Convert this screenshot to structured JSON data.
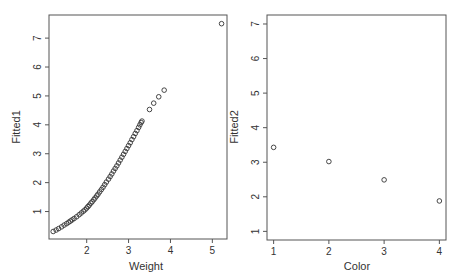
{
  "chart_data": [
    {
      "type": "scatter",
      "title": "",
      "xlabel": "Weight",
      "ylabel": "Fitted1",
      "xlim": [
        1.1,
        5.35
      ],
      "ylim": [
        0.05,
        7.8
      ],
      "xticks": [
        2,
        3,
        4,
        5
      ],
      "yticks": [
        1,
        2,
        3,
        4,
        5,
        6,
        7
      ],
      "grid": false,
      "legend": null,
      "points": [
        [
          1.2,
          0.31
        ],
        [
          1.27,
          0.36
        ],
        [
          1.33,
          0.41
        ],
        [
          1.4,
          0.47
        ],
        [
          1.46,
          0.53
        ],
        [
          1.52,
          0.58
        ],
        [
          1.57,
          0.63
        ],
        [
          1.61,
          0.67
        ],
        [
          1.65,
          0.71
        ],
        [
          1.7,
          0.76
        ],
        [
          1.76,
          0.82
        ],
        [
          1.82,
          0.89
        ],
        [
          1.87,
          0.95
        ],
        [
          1.92,
          1.01
        ],
        [
          1.96,
          1.06
        ],
        [
          2.0,
          1.12
        ],
        [
          2.03,
          1.17
        ],
        [
          2.06,
          1.22
        ],
        [
          2.1,
          1.29
        ],
        [
          2.13,
          1.34
        ],
        [
          2.17,
          1.41
        ],
        [
          2.2,
          1.47
        ],
        [
          2.24,
          1.54
        ],
        [
          2.27,
          1.6
        ],
        [
          2.31,
          1.68
        ],
        [
          2.35,
          1.76
        ],
        [
          2.39,
          1.84
        ],
        [
          2.43,
          1.93
        ],
        [
          2.47,
          2.02
        ],
        [
          2.52,
          2.12
        ],
        [
          2.56,
          2.21
        ],
        [
          2.6,
          2.3
        ],
        [
          2.64,
          2.4
        ],
        [
          2.68,
          2.49
        ],
        [
          2.72,
          2.58
        ],
        [
          2.76,
          2.68
        ],
        [
          2.8,
          2.78
        ],
        [
          2.84,
          2.88
        ],
        [
          2.88,
          2.98
        ],
        [
          2.92,
          3.08
        ],
        [
          2.96,
          3.18
        ],
        [
          3.0,
          3.28
        ],
        [
          3.04,
          3.38
        ],
        [
          3.08,
          3.49
        ],
        [
          3.12,
          3.59
        ],
        [
          3.16,
          3.7
        ],
        [
          3.2,
          3.8
        ],
        [
          3.24,
          3.91
        ],
        [
          3.27,
          4.0
        ],
        [
          3.3,
          4.08
        ],
        [
          3.32,
          4.13
        ],
        [
          3.5,
          4.53
        ],
        [
          3.6,
          4.75
        ],
        [
          3.72,
          4.97
        ],
        [
          3.85,
          5.2
        ],
        [
          5.22,
          7.5
        ]
      ]
    },
    {
      "type": "scatter",
      "title": "",
      "xlabel": "Color",
      "ylabel": "Fitted2",
      "xlim": [
        0.88,
        4.12
      ],
      "ylim": [
        0.75,
        7.26
      ],
      "xticks": [
        1,
        2,
        3,
        4
      ],
      "yticks": [
        1,
        2,
        3,
        4,
        5,
        6,
        7
      ],
      "grid": false,
      "legend": null,
      "categories": [
        1,
        2,
        3,
        4
      ],
      "values": [
        3.43,
        3.02,
        2.49,
        1.88
      ]
    }
  ],
  "panels": {
    "left": {
      "xlabel": "Weight",
      "ylabel": "Fitted1"
    },
    "right": {
      "xlabel": "Color",
      "ylabel": "Fitted2"
    }
  }
}
